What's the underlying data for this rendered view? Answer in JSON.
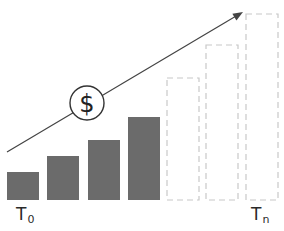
{
  "diagram": {
    "type": "growth-bar-diagram",
    "colors": {
      "solid_bar": "#6b6b6b",
      "dashed_bar": "#c8c8c8",
      "arrow": "#444444",
      "circle": "#333333"
    },
    "icon": {
      "name": "dollar-icon",
      "glyph": "$"
    },
    "labels": {
      "start": {
        "main": "T",
        "sub": "0"
      },
      "end": {
        "main": "T",
        "sub": "n"
      }
    },
    "bars": [
      {
        "kind": "solid",
        "x": 7,
        "top": 172,
        "width": 32
      },
      {
        "kind": "solid",
        "x": 47,
        "top": 156,
        "width": 32
      },
      {
        "kind": "solid",
        "x": 88,
        "top": 140,
        "width": 32
      },
      {
        "kind": "solid",
        "x": 128,
        "top": 117,
        "width": 32
      },
      {
        "kind": "dashed",
        "x": 167,
        "top": 78,
        "width": 32
      },
      {
        "kind": "dashed",
        "x": 206,
        "top": 45,
        "width": 32
      },
      {
        "kind": "dashed",
        "x": 246,
        "top": 14,
        "width": 32
      }
    ],
    "baseline": 200,
    "arrow": {
      "x1": 7,
      "y1": 152,
      "x2": 243,
      "y2": 12
    },
    "circle": {
      "cx": 87,
      "cy": 103,
      "r": 17
    }
  }
}
